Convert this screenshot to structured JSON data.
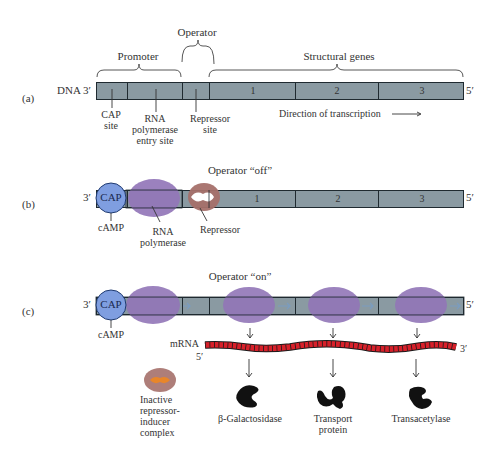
{
  "panel_a": {
    "label": "(a)",
    "dna_label": "DNA 3′",
    "end_label": "5′",
    "brackets": {
      "promoter": "Promoter",
      "operator": "Operator",
      "structural_genes": "Structural genes"
    },
    "genes": [
      "1",
      "2",
      "3"
    ],
    "sites": {
      "cap": [
        "CAP",
        "site"
      ],
      "rna_pol": [
        "RNA",
        "polymerase",
        "entry site"
      ],
      "repressor": [
        "Repressor",
        "site"
      ]
    },
    "direction": "Direction of transcription →"
  },
  "panel_b": {
    "label": "(b)",
    "title": "Operator “off”",
    "start_label": "3′",
    "end_label": "5′",
    "cap": "CAP",
    "camp": "cAMP",
    "rna_pol": [
      "RNA",
      "polymerase"
    ],
    "repressor": "Repressor",
    "genes": [
      "1",
      "2",
      "3"
    ]
  },
  "panel_c": {
    "label": "(c)",
    "title": "Operator “on”",
    "start_label": "3′",
    "end_label": "5′",
    "cap": "CAP",
    "camp": "cAMP",
    "mrna": "mRNA",
    "mrna_5": "5′",
    "mrna_3": "3′",
    "inactive_complex": [
      "Inactive",
      "repressor-",
      "inducer",
      "complex"
    ],
    "proteins": [
      {
        "name": "β-Galactosidase"
      },
      {
        "name": "Transport",
        "name2": "protein"
      },
      {
        "name": "Transacetylase"
      }
    ]
  },
  "colors": {
    "dna": "#8a9aa2",
    "cap": "#7f9ee0",
    "rna_polymerase": "#9276b8",
    "repressor": "#a5706a",
    "inducer": "#e8862a",
    "mrna": "#d8202a",
    "protein": "#111111"
  }
}
